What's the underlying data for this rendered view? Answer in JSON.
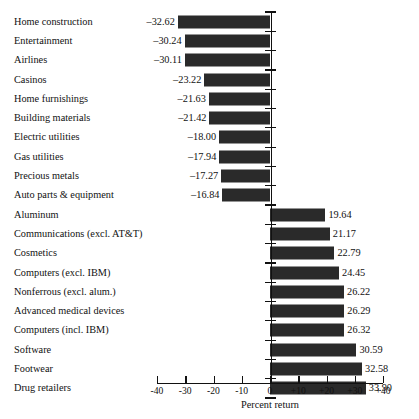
{
  "chart_data": {
    "type": "bar",
    "orientation": "horizontal",
    "title": "",
    "xlabel": "Percent return",
    "ylabel": "",
    "xlim": [
      -40,
      40
    ],
    "grid": false,
    "legend": null,
    "tick_labels": [
      "-40",
      "-30",
      "-20",
      "-10",
      "0",
      "+10",
      "+20",
      "+30",
      "+40"
    ],
    "ticks": [
      -40,
      -30,
      -20,
      -10,
      0,
      10,
      20,
      30,
      40
    ],
    "bar_color": "#2a2a2a",
    "categories": [
      "Home construction",
      "Entertainment",
      "Airlines",
      "Casinos",
      "Home furnishings",
      "Building materials",
      "Electric utilities",
      "Gas utilities",
      "Precious metals",
      "Auto parts & equipment",
      "Aluminum",
      "Communications (excl. AT&T)",
      "Cosmetics",
      "Computers (excl. IBM)",
      "Nonferrous (excl. alum.)",
      "Advanced medical devices",
      "Computers (incl. IBM)",
      "Software",
      "Footwear",
      "Drug retailers"
    ],
    "values": [
      -32.62,
      -30.24,
      -30.11,
      -23.22,
      -21.63,
      -21.42,
      -18.0,
      -17.94,
      -17.27,
      -16.84,
      19.64,
      21.17,
      22.79,
      24.45,
      26.22,
      26.29,
      26.32,
      30.59,
      32.58,
      33.9
    ],
    "value_labels": [
      "–32.62",
      "–30.24",
      "–30.11",
      "–23.22",
      "–21.63",
      "–21.42",
      "–18.00",
      "–17.94",
      "–17.27",
      "–16.84",
      "19.64",
      "21.17",
      "22.79",
      "24.45",
      "26.22",
      "26.29",
      "26.32",
      "30.59",
      "32.58",
      "33.90"
    ]
  }
}
